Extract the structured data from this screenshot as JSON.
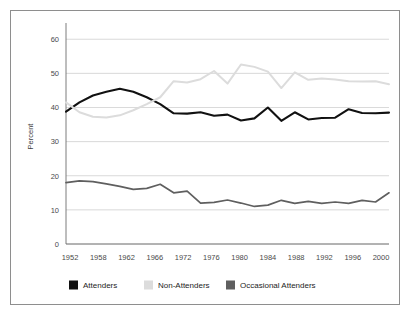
{
  "chart_data": {
    "type": "line",
    "title": "",
    "xlabel": "",
    "ylabel": "Percent",
    "ylim": [
      0,
      63
    ],
    "xlim": [
      1952,
      2000
    ],
    "grid": true,
    "legend_position": "bottom",
    "y_ticks": [
      0,
      10,
      20,
      30,
      40,
      50,
      60
    ],
    "y_tick_labels": [
      "0",
      "10",
      "20",
      "30",
      "40",
      "50",
      "60"
    ],
    "x_tick_labels": [
      "1952",
      "1958",
      "1962",
      "1966",
      "1972",
      "1976",
      "1980",
      "1984",
      "1988",
      "1992",
      "1996",
      "2000"
    ],
    "x": [
      1952,
      1954,
      1956,
      1958,
      1960,
      1962,
      1964,
      1966,
      1968,
      1970,
      1972,
      1974,
      1976,
      1978,
      1980,
      1982,
      1984,
      1986,
      1988,
      1990,
      1992,
      1994,
      1996,
      1998,
      2000
    ],
    "series": [
      {
        "name": "Attenders",
        "color": "#111111",
        "values": [
          38.8,
          41.5,
          43.5,
          44.6,
          45.5,
          44.6,
          43.0,
          41.0,
          38.3,
          38.2,
          38.6,
          37.6,
          37.9,
          36.2,
          36.8,
          40.0,
          36.1,
          38.6,
          36.5,
          36.9,
          37.0,
          39.5,
          38.4,
          38.3,
          38.5
        ]
      },
      {
        "name": "Non-Attenders",
        "color": "#dcdcdc",
        "values": [
          41.5,
          38.6,
          37.3,
          37.1,
          37.7,
          39.2,
          41.0,
          43.0,
          47.7,
          47.3,
          48.3,
          50.7,
          47.0,
          52.6,
          51.9,
          50.5,
          45.7,
          50.3,
          48.1,
          48.5,
          48.2,
          47.7,
          47.6,
          47.7,
          46.8
        ]
      },
      {
        "name": "Occasional Attenders",
        "color": "#5f5f5f",
        "values": [
          18.0,
          18.5,
          18.3,
          17.6,
          16.9,
          16.0,
          16.3,
          17.5,
          15.0,
          15.5,
          12.0,
          12.2,
          12.9,
          12.0,
          11.0,
          11.4,
          12.8,
          11.9,
          12.5,
          11.9,
          12.3,
          11.9,
          12.8,
          12.3,
          15.0
        ]
      }
    ]
  },
  "legend": {
    "items": [
      {
        "label": "Attenders",
        "color": "#111111"
      },
      {
        "label": "Non-Attenders",
        "color": "#dcdcdc"
      },
      {
        "label": "Occasional Attenders",
        "color": "#5f5f5f"
      }
    ]
  }
}
